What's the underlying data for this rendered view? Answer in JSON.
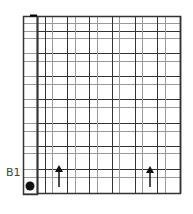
{
  "diagram": {
    "row_label": "B1",
    "colors": {
      "line_dark": "#333333",
      "line_light": "#9a9a9a",
      "marker": "#111111",
      "background": "#ffffff"
    },
    "grid": {
      "left": 23,
      "right": 180,
      "top": 16,
      "bottom": 193,
      "side_column": {
        "left": 23,
        "right": 37,
        "top": 16,
        "bottom": 194
      },
      "vertical_lines": [
        37,
        45,
        52,
        67,
        75,
        89,
        97,
        112,
        119,
        135,
        142,
        157,
        165,
        180
      ],
      "horizontal_lines": [
        16,
        23,
        31,
        38,
        53,
        61,
        76,
        84,
        99,
        107,
        123,
        131,
        146,
        153,
        169,
        177,
        193
      ]
    },
    "markers": [
      {
        "type": "dot",
        "name": "start-dot-icon",
        "cx": 30,
        "cy": 186,
        "r": 4.5
      },
      {
        "type": "arrow-up",
        "name": "arrow-up-icon-1",
        "x": 59,
        "y_tip": 165,
        "y_end": 187
      },
      {
        "type": "arrow-up",
        "name": "arrow-up-icon-2",
        "x": 150,
        "y_tip": 166,
        "y_end": 187
      }
    ]
  }
}
